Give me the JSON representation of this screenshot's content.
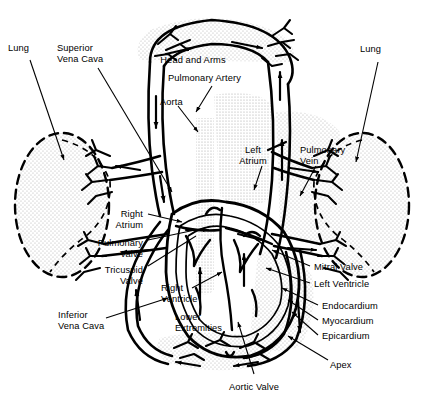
{
  "figure": {
    "type": "anatomical-diagram",
    "ink_color": "#000000",
    "background_color": "#ffffff",
    "stipple_color": "#c9c9c9"
  },
  "labels": [
    {
      "id": "lung-left",
      "text": "Lung",
      "x": 8,
      "y": 43,
      "align": "left"
    },
    {
      "id": "superior-vena-cava",
      "text": "Superior\nVena Cava",
      "x": 57,
      "y": 43,
      "align": "left"
    },
    {
      "id": "head-and-arms",
      "text": "Head and Arms",
      "x": 193,
      "y": 55,
      "align": "center"
    },
    {
      "id": "pulmonary-artery",
      "text": "Pulmonary Artery",
      "x": 168,
      "y": 73,
      "align": "left"
    },
    {
      "id": "aorta",
      "text": "Aorta",
      "x": 160,
      "y": 97,
      "align": "left"
    },
    {
      "id": "lung-right",
      "text": "Lung",
      "x": 360,
      "y": 44,
      "align": "left"
    },
    {
      "id": "left-atrium",
      "text": "Left\nAtrium",
      "x": 253,
      "y": 145,
      "align": "center"
    },
    {
      "id": "pulmonary-vein",
      "text": "Pulmonary\nVein",
      "x": 300,
      "y": 145,
      "align": "left"
    },
    {
      "id": "right-atrium",
      "text": "Right\nAtrium",
      "x": 143,
      "y": 209,
      "align": "right"
    },
    {
      "id": "pulmonary-valve",
      "text": "Pulmonary\nValve",
      "x": 143,
      "y": 238,
      "align": "right"
    },
    {
      "id": "tricuspid-valve",
      "text": "Tricuspid\nValve",
      "x": 143,
      "y": 265,
      "align": "right"
    },
    {
      "id": "right-ventricle",
      "text": "Right\nVentricle",
      "x": 161,
      "y": 283,
      "align": "left"
    },
    {
      "id": "inferior-vena-cava",
      "text": "Inferior\nVena Cava",
      "x": 58,
      "y": 310,
      "align": "left"
    },
    {
      "id": "lower-extremities",
      "text": "Lower\nExtremities",
      "x": 175,
      "y": 312,
      "align": "left"
    },
    {
      "id": "mitral-valve",
      "text": "Mitral Valve",
      "x": 314,
      "y": 262,
      "align": "left"
    },
    {
      "id": "left-ventricle",
      "text": "Left Ventricle",
      "x": 314,
      "y": 279,
      "align": "left"
    },
    {
      "id": "endocardium",
      "text": "Endocardium",
      "x": 322,
      "y": 301,
      "align": "left"
    },
    {
      "id": "myocardium",
      "text": "Myocardium",
      "x": 322,
      "y": 316,
      "align": "left"
    },
    {
      "id": "epicardium",
      "text": "Epicardium",
      "x": 322,
      "y": 331,
      "align": "left"
    },
    {
      "id": "apex",
      "text": "Apex",
      "x": 330,
      "y": 360,
      "align": "left"
    },
    {
      "id": "aortic-valve",
      "text": "Aortic Valve",
      "x": 254,
      "y": 382,
      "align": "center"
    }
  ],
  "structures": {
    "lungs": [
      {
        "id": "lung-left-outline",
        "side": "left",
        "style": "dashed-ellipse",
        "stippled": true
      },
      {
        "id": "lung-right-outline",
        "side": "right",
        "style": "dashed-ellipse",
        "stippled": true
      }
    ],
    "capillary_beds": [
      {
        "id": "head-arms-capillaries",
        "region": "Head and Arms"
      },
      {
        "id": "lung-left-capillaries",
        "region": "Lung"
      },
      {
        "id": "lung-right-capillaries",
        "region": "Lung"
      },
      {
        "id": "lower-extremities-capillaries",
        "region": "Lower Extremities"
      }
    ],
    "chambers": [
      {
        "id": "right-atrium-chamber",
        "name": "Right Atrium"
      },
      {
        "id": "left-atrium-chamber",
        "name": "Left Atrium"
      },
      {
        "id": "right-ventricle-chamber",
        "name": "Right Ventricle"
      },
      {
        "id": "left-ventricle-chamber",
        "name": "Left Ventricle"
      }
    ],
    "valves": [
      {
        "id": "pulmonary-valve-leaflet",
        "name": "Pulmonary Valve"
      },
      {
        "id": "tricuspid-valve-leaflet",
        "name": "Tricuspid Valve"
      },
      {
        "id": "mitral-valve-leaflet",
        "name": "Mitral Valve"
      },
      {
        "id": "aortic-valve-leaflet",
        "name": "Aortic Valve"
      }
    ],
    "wall_layers": [
      "Endocardium",
      "Myocardium",
      "Epicardium"
    ]
  }
}
